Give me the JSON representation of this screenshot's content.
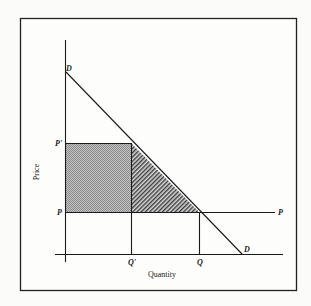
{
  "figure": {
    "type": "supply-demand price-ceiling diagram",
    "axes": {
      "y_label": "Price",
      "x_label": "Quantity"
    },
    "labels": {
      "demand_top": "D",
      "demand_bottom": "D",
      "price_high": "P'",
      "price_low_left": "P",
      "price_low_right": "P",
      "quantity_low": "Q'",
      "quantity_high": "Q"
    },
    "regions": {
      "rectangle_fill": "#a9a9a9",
      "triangle_hatch": "diagonal"
    },
    "colors": {
      "line": "#1a1a1a",
      "background": "#fbfbfa"
    }
  }
}
